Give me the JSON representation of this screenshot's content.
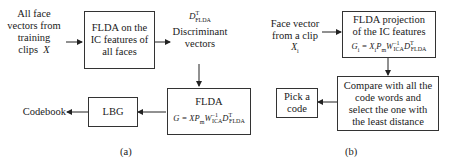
{
  "panel_a": {
    "input_label": [
      "All face",
      "vectors from",
      "training",
      "clips"
    ],
    "input_var": "X",
    "fl_box": [
      "FLDA on the",
      "IC features of",
      "all faces"
    ],
    "disc_symbol": "D",
    "disc_sup": "T",
    "disc_sub": "FLDA",
    "disc_label": [
      "Discriminant",
      "vectors"
    ],
    "flda_box_title": "FLDA",
    "flda_eq": {
      "lhs": "G = XP",
      "pm": "m",
      "w": "W",
      "w_sub": "ICA",
      "w_sup": "−1",
      "d": "D",
      "d_sup": "T",
      "d_sub": "FLDA"
    },
    "lbg_box": "LBG",
    "output_label": "Codebook",
    "caption": "(a)"
  },
  "panel_b": {
    "input_label": [
      "Face vector",
      "from a clip"
    ],
    "input_var": "X",
    "input_var_sub": "i",
    "proj_box": [
      "FLDA projection",
      "of the IC features"
    ],
    "proj_eq": {
      "lhs": "G",
      "lhs_sub": "i",
      "mid": " = X",
      "mid_sub": "i",
      "p": "P",
      "pm": "m",
      "w": "W",
      "w_sub": "ICA",
      "w_sup": "−1",
      "d": "D",
      "d_sup": "T",
      "d_sub": "FLDA"
    },
    "compare_box": [
      "Compare with all the",
      "code words and",
      "select the one with",
      "the least distance"
    ],
    "pick_box": [
      "Pick a",
      "code"
    ],
    "caption": "(b)"
  }
}
